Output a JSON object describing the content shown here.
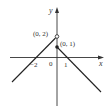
{
  "figure": {
    "type": "piecewise-function-graph",
    "axes": {
      "x_label": "x",
      "y_label": "y",
      "origin_label": "0"
    },
    "tick_labels": {
      "x_neg": "−2",
      "x_pos": "1"
    },
    "points": [
      {
        "label": "(0, 2)",
        "style": "open"
      },
      {
        "label": "(0, 1)",
        "style": "closed"
      }
    ],
    "pieces": [
      {
        "description": "y = x + 2 for x < 0",
        "passes": [
          "(-2, 0)",
          "(0, 2)"
        ]
      },
      {
        "description": "y = 1 - x for x >= 0",
        "passes": [
          "(0, 1)",
          "(1, 0)"
        ]
      }
    ]
  }
}
